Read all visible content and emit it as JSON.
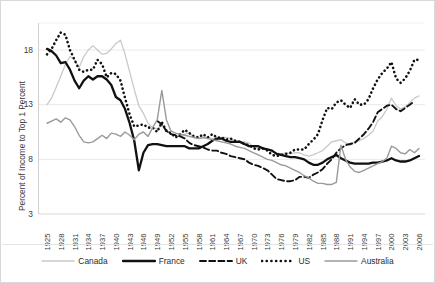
{
  "chart_data": {
    "type": "line",
    "title": "",
    "xlabel": "",
    "ylabel": "Percent of Income to Top 1 Percent",
    "xlim": [
      1925,
      2006
    ],
    "ylim": [
      3,
      20
    ],
    "yticks": [
      3,
      8,
      13,
      18
    ],
    "ytick_labels": [
      "3",
      "8",
      "13",
      "18"
    ],
    "xticks": [
      1925,
      1928,
      1931,
      1934,
      1937,
      1940,
      1943,
      1946,
      1949,
      1952,
      1955,
      1958,
      1961,
      1964,
      1967,
      1970,
      1973,
      1976,
      1979,
      1982,
      1985,
      1988,
      1991,
      1994,
      1997,
      2000,
      2003,
      2006
    ],
    "xtick_labels": [
      "1925",
      "1928",
      "1931",
      "1934",
      "1937",
      "1940",
      "1943",
      "1946",
      "1949",
      "1952",
      "1955",
      "1958",
      "1961",
      "1964",
      "1967",
      "1970",
      "1973",
      "1976",
      "1979",
      "1982",
      "1985",
      "1988",
      "1991",
      "1994",
      "1997",
      "2000",
      "2003",
      "2006"
    ],
    "grid": "horizontal",
    "legend_position": "bottom",
    "series": [
      {
        "name": "Canada",
        "style": "solid",
        "color": "#c9c9c9",
        "width": 1.3,
        "x": [
          1925,
          1926,
          1927,
          1928,
          1929,
          1930,
          1931,
          1932,
          1933,
          1934,
          1935,
          1936,
          1937,
          1938,
          1939,
          1940,
          1941,
          1942,
          1943,
          1944,
          1945,
          1946,
          1947,
          1948,
          1949,
          1950,
          1951,
          1952,
          1953,
          1954,
          1955,
          1956,
          1957,
          1958,
          1959,
          1960,
          1961,
          1962,
          1963,
          1964,
          1965,
          1966,
          1967,
          1968,
          1969,
          1970,
          1971,
          1972,
          1973,
          1974,
          1975,
          1976,
          1977,
          1978,
          1979,
          1980,
          1981,
          1982,
          1983,
          1984,
          1985,
          1986,
          1987,
          1988,
          1989,
          1990,
          1991,
          1992,
          1993,
          1994,
          1995,
          1996,
          1997,
          1998,
          1999,
          2000,
          2001,
          2002,
          2003,
          2004,
          2005,
          2006
        ],
        "y": [
          13.0,
          13.6,
          14.6,
          15.6,
          16.7,
          17.4,
          17.1,
          16.4,
          17.4,
          18.0,
          18.4,
          18.0,
          17.6,
          17.7,
          18.1,
          18.6,
          18.9,
          17.6,
          16.0,
          14.4,
          12.9,
          12.2,
          11.3,
          10.9,
          10.8,
          11.1,
          10.6,
          10.3,
          10.2,
          10.1,
          10.3,
          10.4,
          10.0,
          9.9,
          10.0,
          10.0,
          9.9,
          9.9,
          10.0,
          10.0,
          9.9,
          9.7,
          9.6,
          9.6,
          9.5,
          9.1,
          9.0,
          9.0,
          8.9,
          8.7,
          8.6,
          8.5,
          8.6,
          8.5,
          8.6,
          8.6,
          8.4,
          8.3,
          8.4,
          8.6,
          8.8,
          9.2,
          9.6,
          9.7,
          9.8,
          9.5,
          9.3,
          9.6,
          9.7,
          9.9,
          10.2,
          10.6,
          11.5,
          11.9,
          12.6,
          13.6,
          12.9,
          12.6,
          12.8,
          13.2,
          13.6,
          13.8
        ]
      },
      {
        "name": "France",
        "style": "solid",
        "color": "#111111",
        "width": 2.3,
        "x": [
          1925,
          1926,
          1927,
          1928,
          1929,
          1930,
          1931,
          1932,
          1933,
          1934,
          1935,
          1936,
          1937,
          1938,
          1939,
          1940,
          1941,
          1942,
          1943,
          1944,
          1945,
          1946,
          1947,
          1948,
          1949,
          1950,
          1951,
          1952,
          1953,
          1954,
          1955,
          1956,
          1957,
          1958,
          1959,
          1960,
          1961,
          1962,
          1963,
          1964,
          1965,
          1966,
          1967,
          1968,
          1969,
          1970,
          1971,
          1972,
          1973,
          1974,
          1975,
          1976,
          1977,
          1978,
          1979,
          1980,
          1981,
          1982,
          1983,
          1984,
          1985,
          1986,
          1987,
          1988,
          1989,
          1990,
          1991,
          1992,
          1993,
          1994,
          1995,
          1996,
          1997,
          1998,
          1999,
          2000,
          2001,
          2002,
          2003,
          2004,
          2005,
          2006
        ],
        "y": [
          18.1,
          17.9,
          17.5,
          16.8,
          16.9,
          16.2,
          15.2,
          14.5,
          15.2,
          15.6,
          15.3,
          15.6,
          15.6,
          15.3,
          14.8,
          13.7,
          13.4,
          12.6,
          11.3,
          9.7,
          7.0,
          8.6,
          9.3,
          9.4,
          9.4,
          9.3,
          9.2,
          9.2,
          9.2,
          9.2,
          9.2,
          9.0,
          9.0,
          9.0,
          9.2,
          9.4,
          9.7,
          9.9,
          9.9,
          9.7,
          9.6,
          9.6,
          9.6,
          9.4,
          9.2,
          9.2,
          9.2,
          9.0,
          8.9,
          8.8,
          8.5,
          8.4,
          8.3,
          8.2,
          8.2,
          8.1,
          8.0,
          7.7,
          7.5,
          7.5,
          7.7,
          8.0,
          8.2,
          8.4,
          8.1,
          7.9,
          7.7,
          7.6,
          7.6,
          7.6,
          7.6,
          7.7,
          7.7,
          7.8,
          7.9,
          8.1,
          7.9,
          7.8,
          7.8,
          7.9,
          8.1,
          8.3
        ]
      },
      {
        "name": "UK",
        "style": "dashed",
        "color": "#111111",
        "width": 1.9,
        "x": [
          1949,
          1950,
          1951,
          1952,
          1953,
          1954,
          1955,
          1956,
          1957,
          1958,
          1959,
          1960,
          1961,
          1962,
          1963,
          1964,
          1965,
          1966,
          1967,
          1968,
          1969,
          1970,
          1971,
          1972,
          1973,
          1974,
          1975,
          1976,
          1977,
          1978,
          1979,
          1980,
          1981,
          1982,
          1983,
          1984,
          1985,
          1986,
          1987,
          1988,
          1989,
          1990,
          1991,
          1992,
          1993,
          1994,
          1995,
          1996,
          1997,
          1998,
          1999,
          2000,
          2001,
          2002,
          2003,
          2004,
          2005
        ],
        "y": [
          11.5,
          11.2,
          10.6,
          10.3,
          10.2,
          10.1,
          9.9,
          9.5,
          9.3,
          9.2,
          9.1,
          8.9,
          8.8,
          8.8,
          8.6,
          8.5,
          8.3,
          8.2,
          8.1,
          8.0,
          7.7,
          7.5,
          7.4,
          7.2,
          7.0,
          6.6,
          6.2,
          6.1,
          6.0,
          6.0,
          6.1,
          6.4,
          6.4,
          6.3,
          6.6,
          6.8,
          7.1,
          7.6,
          8.0,
          8.6,
          9.0,
          9.3,
          9.4,
          9.5,
          9.9,
          10.3,
          10.8,
          11.4,
          12.3,
          12.6,
          12.9,
          13.0,
          12.6,
          12.4,
          12.7,
          13.0,
          13.3
        ]
      },
      {
        "name": "US",
        "style": "dotted",
        "color": "#111111",
        "width": 2.6,
        "x": [
          1925,
          1926,
          1927,
          1928,
          1929,
          1930,
          1931,
          1932,
          1933,
          1934,
          1935,
          1936,
          1937,
          1938,
          1939,
          1940,
          1941,
          1942,
          1943,
          1944,
          1945,
          1946,
          1947,
          1948,
          1949,
          1950,
          1951,
          1952,
          1953,
          1954,
          1955,
          1956,
          1957,
          1958,
          1959,
          1960,
          1961,
          1962,
          1963,
          1964,
          1965,
          1966,
          1967,
          1968,
          1969,
          1970,
          1971,
          1972,
          1973,
          1974,
          1975,
          1976,
          1977,
          1978,
          1979,
          1980,
          1981,
          1982,
          1983,
          1984,
          1985,
          1986,
          1987,
          1988,
          1989,
          1990,
          1991,
          1992,
          1993,
          1994,
          1995,
          1996,
          1997,
          1998,
          1999,
          2000,
          2001,
          2002,
          2003,
          2004,
          2005,
          2006
        ],
        "y": [
          17.6,
          18.1,
          18.9,
          19.6,
          19.4,
          18.0,
          17.1,
          16.2,
          16.0,
          16.2,
          16.2,
          17.1,
          16.7,
          15.5,
          15.9,
          15.8,
          15.2,
          13.6,
          12.1,
          11.0,
          11.1,
          11.2,
          10.9,
          10.9,
          10.5,
          11.4,
          10.6,
          10.4,
          10.0,
          10.3,
          10.7,
          10.4,
          10.1,
          10.0,
          10.3,
          10.0,
          10.3,
          10.0,
          10.0,
          9.8,
          9.9,
          9.7,
          9.6,
          9.4,
          9.3,
          9.0,
          8.9,
          9.0,
          8.8,
          8.4,
          8.3,
          8.4,
          8.5,
          8.6,
          8.9,
          8.9,
          8.9,
          9.4,
          9.8,
          10.3,
          11.6,
          12.7,
          12.6,
          13.2,
          13.4,
          13.0,
          12.7,
          13.5,
          13.0,
          13.0,
          13.5,
          14.5,
          15.3,
          15.9,
          16.3,
          16.9,
          15.4,
          15.0,
          15.4,
          16.1,
          17.1,
          17.1
        ]
      },
      {
        "name": "Australia",
        "style": "solid",
        "color": "#9a9a9a",
        "width": 1.4,
        "x": [
          1925,
          1926,
          1927,
          1928,
          1929,
          1930,
          1931,
          1932,
          1933,
          1934,
          1935,
          1936,
          1937,
          1938,
          1939,
          1940,
          1941,
          1942,
          1943,
          1944,
          1945,
          1946,
          1947,
          1948,
          1949,
          1950,
          1951,
          1952,
          1953,
          1954,
          1955,
          1956,
          1957,
          1958,
          1959,
          1960,
          1961,
          1962,
          1963,
          1964,
          1965,
          1966,
          1967,
          1968,
          1969,
          1970,
          1971,
          1972,
          1973,
          1974,
          1975,
          1976,
          1977,
          1978,
          1979,
          1980,
          1981,
          1982,
          1983,
          1984,
          1985,
          1986,
          1987,
          1988,
          1989,
          1990,
          1991,
          1992,
          1993,
          1994,
          1995,
          1996,
          1997,
          1998,
          1999,
          2000,
          2001,
          2002,
          2003,
          2004,
          2005,
          2006
        ],
        "y": [
          11.3,
          11.5,
          11.7,
          11.4,
          11.8,
          11.6,
          11.0,
          10.2,
          9.6,
          9.5,
          9.6,
          9.9,
          10.2,
          9.9,
          10.4,
          10.3,
          10.1,
          10.5,
          10.2,
          9.8,
          10.3,
          10.5,
          10.1,
          10.9,
          11.6,
          14.3,
          11.6,
          10.6,
          10.4,
          10.3,
          10.2,
          10.1,
          10.0,
          9.9,
          10.0,
          9.9,
          9.8,
          9.7,
          9.6,
          9.5,
          9.4,
          9.2,
          9.1,
          9.0,
          8.8,
          8.6,
          8.4,
          8.2,
          8.0,
          7.9,
          7.7,
          7.5,
          7.4,
          7.2,
          7.0,
          6.8,
          6.5,
          6.3,
          6.0,
          5.8,
          5.8,
          5.7,
          5.7,
          5.9,
          9.3,
          8.0,
          7.3,
          6.9,
          6.8,
          7.0,
          7.2,
          7.4,
          7.6,
          7.8,
          8.1,
          9.2,
          9.0,
          8.6,
          8.5,
          8.9,
          8.6,
          9.0
        ]
      }
    ]
  },
  "legend": {
    "items": [
      {
        "label": "Canada"
      },
      {
        "label": "France"
      },
      {
        "label": "UK"
      },
      {
        "label": "US"
      },
      {
        "label": "Australia"
      }
    ]
  }
}
